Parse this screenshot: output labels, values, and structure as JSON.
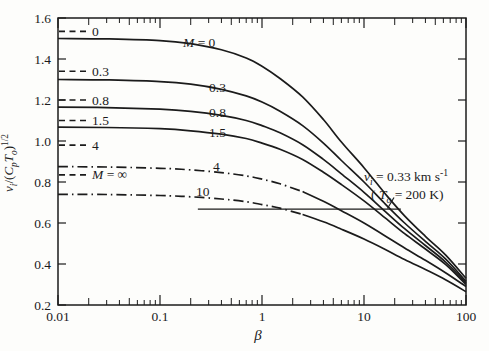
{
  "page": {
    "background": "#fdfdfb",
    "ink": "#1b1b1b"
  },
  "chart_data": {
    "type": "line",
    "title": "",
    "xlabel": "β",
    "ylabel": "v_i/(C_p T_o)^(1/2)",
    "x_scale": "log",
    "y_scale": "linear",
    "xlim": [
      0.01,
      100
    ],
    "ylim": [
      0.2,
      1.6
    ],
    "grid": false,
    "x_ticks": [
      0.01,
      0.1,
      1,
      10,
      100
    ],
    "x_tick_labels": [
      "0.01",
      "0.1",
      "1",
      "10",
      "100"
    ],
    "y_ticks": [
      0.2,
      0.4,
      0.6,
      0.8,
      1.0,
      1.2,
      1.4,
      1.6
    ],
    "y_tick_labels": [
      "0.2",
      "0.4",
      "0.6",
      "0.8",
      "1.0",
      "1.2",
      "1.4",
      "1.6"
    ],
    "right_axis_ticks": [
      0.4,
      0.6,
      0.8,
      1.0,
      1.2,
      1.4
    ],
    "ylabel_rich": [
      {
        "t": "v",
        "s": "it"
      },
      {
        "t": "i",
        "s": "sub"
      },
      {
        "t": "/(",
        "s": "n"
      },
      {
        "t": "C",
        "s": "it"
      },
      {
        "t": "p",
        "s": "sub"
      },
      {
        "t": "T",
        "s": "it"
      },
      {
        "t": "o",
        "s": "sub"
      },
      {
        "t": ")",
        "s": "n"
      },
      {
        "t": "1/2",
        "s": "sup"
      }
    ],
    "xlabel_rich": [
      {
        "t": "β",
        "s": "it"
      }
    ],
    "series": [
      {
        "name": "M = 0",
        "dash": "solid",
        "label_rich": [
          {
            "t": "M",
            "s": "it"
          },
          {
            "t": " = 0",
            "s": "n"
          }
        ],
        "label_px": [
          183,
          47
        ],
        "points": [
          [
            0.01,
            1.5
          ],
          [
            0.03,
            1.498
          ],
          [
            0.1,
            1.49
          ],
          [
            0.2,
            1.475
          ],
          [
            0.4,
            1.445
          ],
          [
            0.7,
            1.405
          ],
          [
            1,
            1.365
          ],
          [
            1.5,
            1.305
          ],
          [
            2.5,
            1.215
          ],
          [
            4,
            1.105
          ],
          [
            6,
            0.995
          ],
          [
            10,
            0.87
          ],
          [
            16,
            0.745
          ],
          [
            25,
            0.635
          ],
          [
            40,
            0.535
          ],
          [
            63,
            0.445
          ],
          [
            100,
            0.33
          ]
        ]
      },
      {
        "name": "0.3",
        "dash": "solid",
        "label_rich": [
          {
            "t": "0.3",
            "s": "n"
          }
        ],
        "label_px": [
          209,
          92
        ],
        "points": [
          [
            0.01,
            1.3
          ],
          [
            0.03,
            1.298
          ],
          [
            0.1,
            1.29
          ],
          [
            0.2,
            1.277
          ],
          [
            0.4,
            1.252
          ],
          [
            0.7,
            1.22
          ],
          [
            1,
            1.19
          ],
          [
            1.5,
            1.145
          ],
          [
            2.5,
            1.075
          ],
          [
            4,
            0.99
          ],
          [
            6,
            0.905
          ],
          [
            10,
            0.8
          ],
          [
            16,
            0.695
          ],
          [
            25,
            0.6
          ],
          [
            40,
            0.51
          ],
          [
            63,
            0.425
          ],
          [
            100,
            0.315
          ]
        ]
      },
      {
        "name": "0.8",
        "dash": "solid",
        "label_rich": [
          {
            "t": "0.8",
            "s": "n"
          }
        ],
        "label_px": [
          209,
          117
        ],
        "points": [
          [
            0.01,
            1.165
          ],
          [
            0.03,
            1.163
          ],
          [
            0.1,
            1.155
          ],
          [
            0.2,
            1.145
          ],
          [
            0.4,
            1.125
          ],
          [
            0.7,
            1.1
          ],
          [
            1,
            1.075
          ],
          [
            1.5,
            1.04
          ],
          [
            2.5,
            0.982
          ],
          [
            4,
            0.91
          ],
          [
            6,
            0.84
          ],
          [
            10,
            0.75
          ],
          [
            16,
            0.658
          ],
          [
            25,
            0.572
          ],
          [
            40,
            0.49
          ],
          [
            63,
            0.41
          ],
          [
            100,
            0.308
          ]
        ]
      },
      {
        "name": "1.5",
        "dash": "solid",
        "label_rich": [
          {
            "t": "1.5",
            "s": "n"
          }
        ],
        "label_px": [
          209,
          137
        ],
        "points": [
          [
            0.01,
            1.068
          ],
          [
            0.03,
            1.066
          ],
          [
            0.1,
            1.06
          ],
          [
            0.2,
            1.05
          ],
          [
            0.4,
            1.033
          ],
          [
            0.7,
            1.012
          ],
          [
            1,
            0.99
          ],
          [
            1.5,
            0.96
          ],
          [
            2.5,
            0.91
          ],
          [
            4,
            0.848
          ],
          [
            6,
            0.788
          ],
          [
            10,
            0.708
          ],
          [
            16,
            0.626
          ],
          [
            25,
            0.548
          ],
          [
            40,
            0.473
          ],
          [
            63,
            0.398
          ],
          [
            100,
            0.3
          ]
        ]
      },
      {
        "name": "4",
        "dash": "dashdot",
        "solid_from": 2.5,
        "label_rich": [
          {
            "t": "4",
            "s": "n"
          }
        ],
        "label_px": [
          213,
          171
        ],
        "points": [
          [
            0.01,
            0.875
          ],
          [
            0.03,
            0.873
          ],
          [
            0.1,
            0.867
          ],
          [
            0.2,
            0.859
          ],
          [
            0.4,
            0.846
          ],
          [
            0.7,
            0.83
          ],
          [
            1,
            0.814
          ],
          [
            1.5,
            0.791
          ],
          [
            2.5,
            0.753
          ],
          [
            4,
            0.706
          ],
          [
            6,
            0.66
          ],
          [
            10,
            0.6
          ],
          [
            16,
            0.538
          ],
          [
            25,
            0.478
          ],
          [
            40,
            0.418
          ],
          [
            63,
            0.357
          ],
          [
            100,
            0.29
          ]
        ]
      },
      {
        "name": "10",
        "dash": "dashdot",
        "solid_from": 2.5,
        "label_rich": [
          {
            "t": "10",
            "s": "n"
          }
        ],
        "label_px": [
          196,
          196
        ],
        "points": [
          [
            0.01,
            0.74
          ],
          [
            0.03,
            0.739
          ],
          [
            0.1,
            0.734
          ],
          [
            0.2,
            0.728
          ],
          [
            0.4,
            0.717
          ],
          [
            0.7,
            0.704
          ],
          [
            1,
            0.69
          ],
          [
            1.5,
            0.672
          ],
          [
            2.5,
            0.642
          ],
          [
            4,
            0.606
          ],
          [
            6,
            0.57
          ],
          [
            10,
            0.522
          ],
          [
            16,
            0.472
          ],
          [
            25,
            0.422
          ],
          [
            40,
            0.373
          ],
          [
            63,
            0.323
          ],
          [
            100,
            0.265
          ]
        ]
      }
    ],
    "beta_zero_asymptotes": [
      {
        "label": "0",
        "rich": [
          {
            "t": "0",
            "s": "n"
          }
        ],
        "value": 1.535
      },
      {
        "label": "0.3",
        "rich": [
          {
            "t": "0.3",
            "s": "n"
          }
        ],
        "value": 1.34
      },
      {
        "label": "0.8",
        "rich": [
          {
            "t": "0.8",
            "s": "n"
          }
        ],
        "value": 1.2
      },
      {
        "label": "1.5",
        "rich": [
          {
            "t": "1.5",
            "s": "n"
          }
        ],
        "value": 1.1
      },
      {
        "label": "4",
        "rich": [
          {
            "t": "4",
            "s": "n"
          }
        ],
        "value": 0.98
      },
      {
        "label": "M = ∞",
        "rich": [
          {
            "t": "M",
            "s": "it"
          },
          {
            "t": " = ∞",
            "s": "n"
          }
        ],
        "value": 0.835
      }
    ],
    "reference_line": {
      "value": 0.668,
      "beta_start": 0.235,
      "beta_end": 23
    },
    "annotation": {
      "line1": "v_i = 0.33 km s^-1",
      "line2": "( T_o = 200 K )",
      "line1_rich": [
        {
          "t": "v",
          "s": "it"
        },
        {
          "t": "i",
          "s": "sub"
        },
        {
          "t": " = 0.33 km s",
          "s": "n"
        },
        {
          "t": "-1",
          "s": "sup"
        }
      ],
      "line2_rich": [
        {
          "t": "( ",
          "s": "n"
        },
        {
          "t": "T",
          "s": "it"
        },
        {
          "t": "o",
          "s": "sub"
        },
        {
          "t": " = 200 K)",
          "s": "n"
        }
      ],
      "line1_px": [
        364,
        181
      ],
      "line2_px": [
        371,
        199
      ]
    }
  }
}
